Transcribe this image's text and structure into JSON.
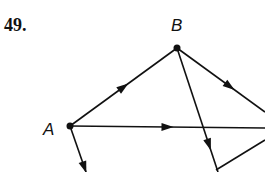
{
  "problem_number": "49.",
  "nodes": [
    {
      "id": "B",
      "label": "B",
      "x": 177,
      "y": 48,
      "label_x": 171,
      "label_y": 16
    },
    {
      "id": "A",
      "label": "A",
      "x": 70,
      "y": 126,
      "label_x": 43,
      "label_y": 120
    }
  ],
  "edges": [
    {
      "from": "A",
      "to": "B",
      "x1": 70,
      "y1": 126,
      "x2": 177,
      "y2": 48,
      "arrow_at": 0.5
    },
    {
      "from": "B",
      "to": "right",
      "x1": 177,
      "y1": 48,
      "x2": 265,
      "y2": 112,
      "arrow_at": 0.6
    },
    {
      "from": "A",
      "to": "right",
      "x1": 70,
      "y1": 126,
      "x2": 265,
      "y2": 128,
      "arrow_at": 0.5
    },
    {
      "from": "B",
      "to": "bottom",
      "x1": 177,
      "y1": 48,
      "x2": 218,
      "y2": 172,
      "arrow_at": 0.78
    },
    {
      "from": "bottom",
      "to": "right",
      "x1": 216,
      "y1": 170,
      "x2": 265,
      "y2": 140,
      "arrow_at": null
    },
    {
      "from": "A",
      "to": "bottom-left",
      "x1": 70,
      "y1": 126,
      "x2": 86,
      "y2": 172,
      "arrow_at": 0.9
    }
  ]
}
